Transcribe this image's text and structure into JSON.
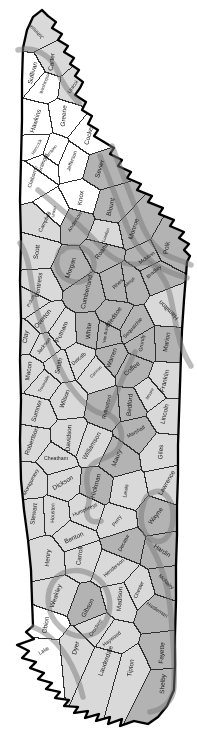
{
  "map": {
    "title": "",
    "background": "#ffffff",
    "state_outline_color": "#000000",
    "county_line_color": "#2e2e2e",
    "band_color": "#7a7a7a",
    "band_opacity": 0.5,
    "band_width": 5.5,
    "label_color": "#1b1b1b",
    "shade_colors": {
      "white": "#ffffff",
      "light": "#d9d9d9",
      "medium": "#b3b3b3"
    },
    "outline": [
      [
        42,
        10
      ],
      [
        48,
        16
      ],
      [
        56,
        22
      ],
      [
        52,
        28
      ],
      [
        62,
        34
      ],
      [
        58,
        40
      ],
      [
        68,
        46
      ],
      [
        64,
        52
      ],
      [
        74,
        58
      ],
      [
        70,
        64
      ],
      [
        79,
        70
      ],
      [
        75,
        76
      ],
      [
        83,
        82
      ],
      [
        80,
        88
      ],
      [
        75,
        95
      ],
      [
        86,
        102
      ],
      [
        82,
        110
      ],
      [
        92,
        116
      ],
      [
        88,
        124
      ],
      [
        98,
        130
      ],
      [
        94,
        136
      ],
      [
        104,
        142
      ],
      [
        114,
        148
      ],
      [
        110,
        154
      ],
      [
        122,
        160
      ],
      [
        118,
        166
      ],
      [
        131,
        172
      ],
      [
        127,
        178
      ],
      [
        141,
        184
      ],
      [
        137,
        190
      ],
      [
        152,
        196
      ],
      [
        148,
        202
      ],
      [
        163,
        208
      ],
      [
        159,
        214
      ],
      [
        174,
        220
      ],
      [
        170,
        226
      ],
      [
        184,
        232
      ],
      [
        179,
        238
      ],
      [
        189,
        244
      ],
      [
        184,
        250
      ],
      [
        190,
        256
      ],
      [
        187,
        262
      ],
      [
        186,
        275
      ],
      [
        184,
        300
      ],
      [
        182,
        330
      ],
      [
        181,
        355
      ],
      [
        180,
        385
      ],
      [
        179,
        415
      ],
      [
        178,
        445
      ],
      [
        178,
        475
      ],
      [
        177,
        505
      ],
      [
        177,
        535
      ],
      [
        176,
        565
      ],
      [
        176,
        600
      ],
      [
        175,
        635
      ],
      [
        175,
        665
      ],
      [
        174,
        690
      ],
      [
        167,
        706
      ],
      [
        158,
        717
      ],
      [
        148,
        724
      ],
      [
        134,
        721
      ],
      [
        120,
        726
      ],
      [
        122,
        719
      ],
      [
        108,
        724
      ],
      [
        110,
        717
      ],
      [
        96,
        721
      ],
      [
        99,
        714
      ],
      [
        85,
        718
      ],
      [
        88,
        711
      ],
      [
        74,
        713
      ],
      [
        78,
        707
      ],
      [
        64,
        706
      ],
      [
        69,
        700
      ],
      [
        55,
        698
      ],
      [
        60,
        692
      ],
      [
        46,
        689
      ],
      [
        52,
        683
      ],
      [
        38,
        679
      ],
      [
        44,
        673
      ],
      [
        30,
        668
      ],
      [
        36,
        662
      ],
      [
        22,
        658
      ],
      [
        29,
        651
      ],
      [
        17,
        645
      ],
      [
        34,
        639
      ],
      [
        26,
        632
      ],
      [
        33,
        626
      ],
      [
        32,
        600
      ],
      [
        31,
        570
      ],
      [
        28,
        540
      ],
      [
        24,
        510
      ],
      [
        21,
        480
      ],
      [
        20,
        440
      ],
      [
        21,
        400
      ],
      [
        20,
        360
      ],
      [
        21,
        320
      ],
      [
        20,
        280
      ],
      [
        21,
        240
      ],
      [
        20,
        200
      ],
      [
        21,
        160
      ],
      [
        22,
        120
      ],
      [
        22,
        80
      ],
      [
        23,
        48
      ],
      [
        27,
        30
      ],
      [
        33,
        17
      ]
    ],
    "bands": [
      "M18,50 C35,46 50,55 57,70 C62,83 70,94 79,103",
      "M112,146 C122,172 131,196 140,220 C148,242 160,254 176,259 C182,261 187,263 191,265",
      "M100,156 C110,180 119,206 128,229 C136,248 148,261 163,269 C171,273 180,276 187,278",
      "M38,190 C58,207 80,224 98,244 C110,258 126,268 141,263 C152,259 159,271 166,283 C172,295 173,314 178,334 C181,348 186,358 191,366",
      "M60,250 C54,262 56,274 68,280 C80,286 92,279 94,266 C95,256 88,249 79,247 C72,246 65,247 62,251",
      "M20,243 C32,261 30,289 38,314 C45,337 53,356 66,380 C79,401 96,416 108,414 C120,421 125,434 119,447 C111,461 93,457 88,471 C83,487 93,493 88,506 C84,518 91,524 101,521",
      "M135,352 C128,365 118,390 108,412",
      "M143,506 C138,522 144,538 155,541 C166,544 174,531 173,513 C172,498 163,489 154,492 C147,494 144,499 143,506",
      "M148,541 C160,560 167,582 170,606 C173,636 175,664 174,687 C173,701 163,710 150,712",
      "M56,578 C44,592 46,614 60,627 C75,641 97,639 106,621 C114,605 109,585 94,576 C81,568 65,569 56,578",
      "M33,627 C46,632 58,643 67,657 C75,670 80,684 83,697"
    ],
    "county_columns": [
      "name",
      "x",
      "y",
      "angle_deg",
      "shade",
      "size"
    ],
    "counties": [
      [
        "Johnson",
        36,
        31,
        -135,
        "light",
        "s"
      ],
      [
        "Sullivan",
        33,
        73,
        -75,
        "white",
        "m"
      ],
      [
        "Carter",
        52,
        62,
        -83,
        "light",
        "m"
      ],
      [
        "Washington",
        45,
        83,
        -70,
        "white",
        "xs"
      ],
      [
        "Unicoi",
        73,
        87,
        -55,
        "light",
        "s"
      ],
      [
        "Hawkins",
        36,
        121,
        -72,
        "white",
        "m"
      ],
      [
        "Greene",
        64,
        116,
        -85,
        "white",
        "m"
      ],
      [
        "Cocke",
        89,
        136,
        -75,
        "white",
        "m"
      ],
      [
        "Hancock",
        37,
        147,
        -60,
        "white",
        "xs"
      ],
      [
        "Hamblen",
        51,
        152,
        -50,
        "white",
        "xs"
      ],
      [
        "Grainger",
        43,
        163,
        -70,
        "white",
        "s"
      ],
      [
        "Jefferson",
        72,
        161,
        -70,
        "white",
        "s"
      ],
      [
        "Sevier",
        100,
        169,
        -73,
        "medium",
        "m"
      ],
      [
        "Claiborne",
        33,
        177,
        -72,
        "white",
        "s"
      ],
      [
        "Union",
        54,
        212,
        -78,
        "white",
        "xs"
      ],
      [
        "Knox",
        81,
        198,
        -82,
        "white",
        "m"
      ],
      [
        "Blount",
        111,
        207,
        -77,
        "medium",
        "m"
      ],
      [
        "Campbell",
        45,
        222,
        -63,
        "light",
        "s"
      ],
      [
        "Anderson",
        75,
        222,
        -58,
        "medium",
        "s"
      ],
      [
        "Loudon",
        106,
        235,
        -70,
        "light",
        "xs"
      ],
      [
        "Monroe",
        134,
        229,
        -72,
        "medium",
        "m"
      ],
      [
        "Scott",
        37,
        252,
        -80,
        "light",
        "m"
      ],
      [
        "Morgan",
        71,
        268,
        -70,
        "medium",
        "m"
      ],
      [
        "Roane",
        102,
        251,
        -55,
        "medium",
        "m"
      ],
      [
        "Polk",
        167,
        248,
        -80,
        "medium",
        "m"
      ],
      [
        "McMinn",
        147,
        258,
        -35,
        "medium",
        "s"
      ],
      [
        "Bradley",
        154,
        272,
        -40,
        "medium",
        "s"
      ],
      [
        "Fentress",
        39,
        285,
        -82,
        "light",
        "m"
      ],
      [
        "Cumberland",
        87,
        292,
        -77,
        "medium",
        "m"
      ],
      [
        "Meigs",
        130,
        282,
        -45,
        "medium",
        "xs"
      ],
      [
        "Rhea",
        118,
        284,
        -45,
        "medium",
        "s"
      ],
      [
        "Pickett",
        31,
        301,
        -65,
        "light",
        "xs"
      ],
      [
        "Overton",
        43,
        319,
        -50,
        "light",
        "m"
      ],
      [
        "Clay",
        26,
        337,
        -82,
        "light",
        "m"
      ],
      [
        "Putnam",
        62,
        332,
        -65,
        "light",
        "m"
      ],
      [
        "White",
        89,
        331,
        -85,
        "medium",
        "m"
      ],
      [
        "Bledsoe",
        114,
        317,
        -55,
        "medium",
        "m"
      ],
      [
        "Van Buren",
        106,
        333,
        -80,
        "medium",
        "xs"
      ],
      [
        "Sequatchie",
        133,
        328,
        -48,
        "medium",
        "s"
      ],
      [
        "Hamilton",
        169,
        310,
        -135,
        "light",
        "m"
      ],
      [
        "Marion",
        167,
        342,
        -80,
        "medium",
        "m"
      ],
      [
        "Grundy",
        142,
        343,
        -80,
        "medium",
        "s"
      ],
      [
        "Jackson",
        44,
        346,
        -52,
        "light",
        "s"
      ],
      [
        "Macon",
        29,
        371,
        -82,
        "light",
        "m"
      ],
      [
        "Smith",
        59,
        366,
        -76,
        "light",
        "m"
      ],
      [
        "DeKalb",
        79,
        359,
        -40,
        "light",
        "s"
      ],
      [
        "Warren",
        112,
        358,
        -70,
        "medium",
        "m"
      ],
      [
        "Coffee",
        132,
        369,
        -40,
        "medium",
        "m"
      ],
      [
        "Franklin",
        165,
        381,
        -76,
        "light",
        "m"
      ],
      [
        "Trousdale",
        44,
        384,
        -60,
        "light",
        "xs"
      ],
      [
        "Sumner",
        37,
        411,
        -72,
        "light",
        "m"
      ],
      [
        "Wilson",
        65,
        399,
        -70,
        "light",
        "m"
      ],
      [
        "Cannon",
        96,
        372,
        -45,
        "light",
        "xs"
      ],
      [
        "Rutherford",
        107,
        407,
        -75,
        "medium",
        "s"
      ],
      [
        "Bedford",
        130,
        405,
        -85,
        "medium",
        "m"
      ],
      [
        "Moore",
        150,
        394,
        -60,
        "light",
        "xs"
      ],
      [
        "Lincoln",
        165,
        414,
        -78,
        "light",
        "m"
      ],
      [
        "Marshall",
        136,
        432,
        -30,
        "medium",
        "s"
      ],
      [
        "Davidson",
        69,
        438,
        -86,
        "light",
        "m"
      ],
      [
        "Robertson",
        32,
        441,
        -70,
        "light",
        "m"
      ],
      [
        "Cheatham",
        56,
        459,
        0,
        "light",
        "s"
      ],
      [
        "Williamson",
        92,
        446,
        -60,
        "light",
        "m"
      ],
      [
        "Maury",
        117,
        458,
        -68,
        "medium",
        "m"
      ],
      [
        "Giles",
        161,
        452,
        -86,
        "light",
        "m"
      ],
      [
        "Montgomery",
        31,
        482,
        -62,
        "light",
        "s"
      ],
      [
        "Dickson",
        63,
        483,
        -30,
        "light",
        "m"
      ],
      [
        "Hickman",
        96,
        486,
        -75,
        "medium",
        "m"
      ],
      [
        "Lewis",
        126,
        491,
        -80,
        "light",
        "s"
      ],
      [
        "Lawrence",
        167,
        483,
        -60,
        "light",
        "m"
      ],
      [
        "Stewart",
        34,
        514,
        -82,
        "light",
        "m"
      ],
      [
        "Houston",
        53,
        513,
        -88,
        "light",
        "s"
      ],
      [
        "Humphreys",
        85,
        510,
        -25,
        "light",
        "s"
      ],
      [
        "Perry",
        117,
        521,
        -55,
        "light",
        "s"
      ],
      [
        "Wayne",
        156,
        516,
        -52,
        "medium",
        "m"
      ],
      [
        "Benton",
        74,
        538,
        -25,
        "light",
        "m"
      ],
      [
        "Decatur",
        124,
        543,
        -62,
        "medium",
        "s"
      ],
      [
        "Hardin",
        162,
        551,
        33,
        "medium",
        "m"
      ],
      [
        "Henry",
        48,
        558,
        -85,
        "light",
        "m"
      ],
      [
        "Carroll",
        80,
        556,
        -82,
        "light",
        "m"
      ],
      [
        "Henderson",
        114,
        568,
        -40,
        "light",
        "s"
      ],
      [
        "Chester",
        139,
        590,
        -65,
        "light",
        "s"
      ],
      [
        "McNairy",
        166,
        582,
        45,
        "medium",
        "s"
      ],
      [
        "Weakley",
        56,
        596,
        -70,
        "light",
        "m"
      ],
      [
        "Gibson",
        88,
        608,
        -62,
        "medium",
        "m"
      ],
      [
        "Madison",
        120,
        599,
        -86,
        "light",
        "m"
      ],
      [
        "Hardeman",
        157,
        610,
        33,
        "medium",
        "s"
      ],
      [
        "Obion",
        46,
        625,
        -80,
        "white",
        "m"
      ],
      [
        "Crockett",
        96,
        628,
        -55,
        "light",
        "s"
      ],
      [
        "Haywood",
        112,
        639,
        -38,
        "light",
        "s"
      ],
      [
        "Lake",
        44,
        651,
        -30,
        "white",
        "s"
      ],
      [
        "Dyer",
        76,
        648,
        -76,
        "light",
        "m"
      ],
      [
        "Lauderdale",
        106,
        661,
        -70,
        "light",
        "m"
      ],
      [
        "Tipton",
        131,
        668,
        -80,
        "light",
        "m"
      ],
      [
        "Fayette",
        162,
        653,
        -86,
        "medium",
        "m"
      ],
      [
        "Shelby",
        163,
        684,
        -86,
        "medium",
        "m"
      ]
    ]
  }
}
